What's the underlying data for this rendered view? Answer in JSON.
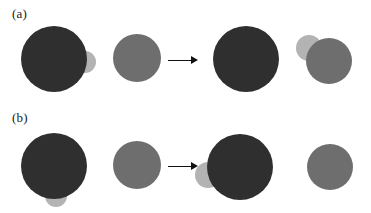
{
  "figure": {
    "width": 371,
    "height": 213,
    "background": "#ffffff"
  },
  "colors": {
    "dark_disc": "#2f2f2f",
    "medium_disc": "#6e6e6e",
    "light_disc": "#b3b3b3",
    "arrow": "#111111",
    "label_text": "#1a1a1a",
    "background": "#ffffff"
  },
  "panels": [
    {
      "id": "panel-a",
      "label": "(a)",
      "label_x": 12,
      "label_y": 7,
      "row_top": 0,
      "row_height": 107,
      "arrow": {
        "x": 168,
        "y": 60,
        "length": 30,
        "name": "arrow-a"
      },
      "discs": [
        {
          "name": "disc-a-light-left",
          "role": "light",
          "cx": 85,
          "cy": 62,
          "r": 11,
          "z": 1
        },
        {
          "name": "disc-a-dark-left",
          "role": "dark",
          "cx": 54,
          "cy": 59,
          "r": 33,
          "z": 2
        },
        {
          "name": "disc-a-medium-left",
          "role": "medium",
          "cx": 137,
          "cy": 58,
          "r": 24,
          "z": 2
        },
        {
          "name": "disc-a-dark-right",
          "role": "dark",
          "cx": 246,
          "cy": 59,
          "r": 33,
          "z": 2
        },
        {
          "name": "disc-a-light-right",
          "role": "light",
          "cx": 309,
          "cy": 48,
          "r": 13,
          "z": 1
        },
        {
          "name": "disc-a-medium-right",
          "role": "medium",
          "cx": 329,
          "cy": 61,
          "r": 23,
          "z": 2
        }
      ]
    },
    {
      "id": "panel-b",
      "label": "(b)",
      "label_x": 12,
      "label_y": 111,
      "row_top": 107,
      "row_height": 106,
      "arrow": {
        "x": 168,
        "y": 166,
        "length": 30,
        "name": "arrow-b"
      },
      "discs": [
        {
          "name": "disc-b-light-left",
          "role": "light",
          "cx": 56,
          "cy": 196,
          "r": 11,
          "z": 1
        },
        {
          "name": "disc-b-dark-left",
          "role": "dark",
          "cx": 54,
          "cy": 166,
          "r": 33,
          "z": 2
        },
        {
          "name": "disc-b-medium-left",
          "role": "medium",
          "cx": 137,
          "cy": 165,
          "r": 24,
          "z": 2
        },
        {
          "name": "disc-b-light-right",
          "role": "light",
          "cx": 208,
          "cy": 175,
          "r": 13,
          "z": 1
        },
        {
          "name": "disc-b-dark-right",
          "role": "dark",
          "cx": 240,
          "cy": 167,
          "r": 33,
          "z": 2
        },
        {
          "name": "disc-b-medium-right",
          "role": "medium",
          "cx": 330,
          "cy": 167,
          "r": 23,
          "z": 2
        }
      ]
    }
  ]
}
